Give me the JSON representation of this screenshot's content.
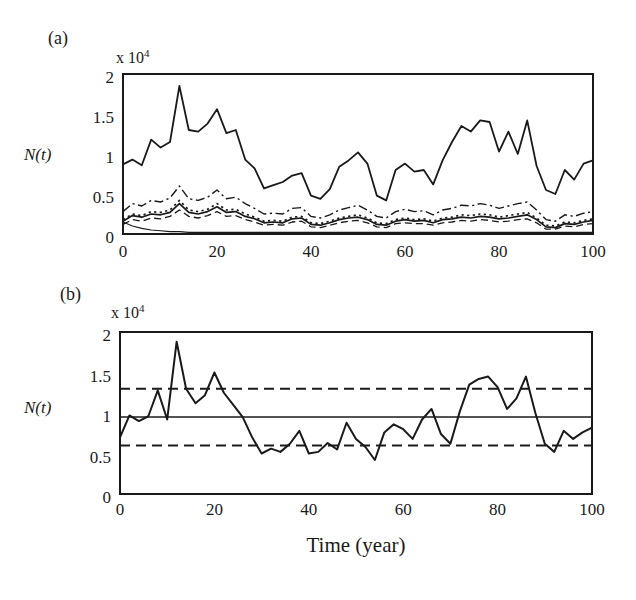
{
  "figure": {
    "xlabel": "Time (year)",
    "colors": {
      "background": "#ffffff",
      "ink": "#1a1a1a"
    }
  },
  "chart_data": [
    {
      "id": "panel-a",
      "type": "line",
      "panel_label": "(a)",
      "scale_label": {
        "base": "x 10",
        "exp": "4"
      },
      "ylabel": "N(t)",
      "xlim": [
        0,
        100
      ],
      "ylim": [
        0,
        2
      ],
      "grid": false,
      "legend": false,
      "x_ticks": [
        {
          "label": "0",
          "value": 0
        },
        {
          "label": "20",
          "value": 20
        },
        {
          "label": "40",
          "value": 40
        },
        {
          "label": "60",
          "value": 60
        },
        {
          "label": "80",
          "value": 80
        },
        {
          "label": "100",
          "value": 100
        }
      ],
      "y_ticks": [
        {
          "label": "2",
          "value": 2
        },
        {
          "label": "1.5",
          "value": 1.5
        },
        {
          "label": "1",
          "value": 1
        },
        {
          "label": "0.5",
          "value": 0.5
        },
        {
          "label": "0",
          "value": 0
        }
      ],
      "x": [
        0,
        2,
        4,
        6,
        8,
        10,
        12,
        14,
        16,
        18,
        20,
        22,
        24,
        26,
        28,
        30,
        32,
        34,
        36,
        38,
        40,
        42,
        44,
        46,
        48,
        50,
        52,
        54,
        56,
        58,
        60,
        62,
        64,
        66,
        68,
        70,
        72,
        74,
        76,
        78,
        80,
        82,
        84,
        86,
        88,
        90,
        92,
        94,
        96,
        98,
        100
      ],
      "series": [
        {
          "name": "total-population-solid",
          "style": "solid",
          "width": 1.8,
          "values": [
            0.87,
            0.93,
            0.86,
            1.18,
            1.08,
            1.15,
            1.85,
            1.3,
            1.28,
            1.38,
            1.56,
            1.26,
            1.3,
            0.93,
            0.82,
            0.57,
            0.61,
            0.65,
            0.73,
            0.76,
            0.48,
            0.44,
            0.56,
            0.84,
            0.92,
            1.02,
            0.88,
            0.48,
            0.42,
            0.8,
            0.88,
            0.78,
            0.8,
            0.62,
            0.92,
            1.15,
            1.35,
            1.28,
            1.42,
            1.4,
            1.03,
            1.28,
            1.0,
            1.42,
            0.85,
            0.55,
            0.5,
            0.8,
            0.68,
            0.88,
            0.92
          ]
        },
        {
          "name": "subpopulation-dash-dot",
          "style": "dashdot",
          "width": 1.4,
          "values": [
            0.28,
            0.38,
            0.35,
            0.42,
            0.4,
            0.45,
            0.6,
            0.44,
            0.42,
            0.46,
            0.55,
            0.44,
            0.46,
            0.38,
            0.32,
            0.25,
            0.26,
            0.25,
            0.32,
            0.33,
            0.22,
            0.2,
            0.24,
            0.3,
            0.33,
            0.36,
            0.3,
            0.22,
            0.2,
            0.28,
            0.31,
            0.28,
            0.29,
            0.24,
            0.3,
            0.32,
            0.36,
            0.35,
            0.38,
            0.36,
            0.32,
            0.35,
            0.38,
            0.4,
            0.3,
            0.18,
            0.16,
            0.24,
            0.22,
            0.26,
            0.28
          ]
        },
        {
          "name": "subpopulation-dotted",
          "style": "dotted",
          "width": 1.7,
          "values": [
            0.18,
            0.25,
            0.23,
            0.28,
            0.27,
            0.3,
            0.42,
            0.3,
            0.28,
            0.31,
            0.38,
            0.3,
            0.31,
            0.25,
            0.21,
            0.16,
            0.17,
            0.16,
            0.21,
            0.22,
            0.14,
            0.13,
            0.16,
            0.2,
            0.22,
            0.24,
            0.2,
            0.14,
            0.13,
            0.18,
            0.2,
            0.18,
            0.19,
            0.16,
            0.2,
            0.21,
            0.24,
            0.23,
            0.25,
            0.24,
            0.21,
            0.23,
            0.25,
            0.27,
            0.2,
            0.11,
            0.1,
            0.15,
            0.14,
            0.17,
            0.19
          ]
        },
        {
          "name": "subpopulation-solid",
          "style": "solid",
          "width": 1.7,
          "values": [
            0.16,
            0.23,
            0.21,
            0.25,
            0.24,
            0.27,
            0.38,
            0.27,
            0.25,
            0.28,
            0.34,
            0.27,
            0.28,
            0.22,
            0.19,
            0.14,
            0.15,
            0.14,
            0.19,
            0.2,
            0.12,
            0.11,
            0.14,
            0.18,
            0.2,
            0.21,
            0.18,
            0.12,
            0.11,
            0.16,
            0.18,
            0.16,
            0.17,
            0.14,
            0.18,
            0.19,
            0.21,
            0.2,
            0.22,
            0.21,
            0.19,
            0.2,
            0.22,
            0.24,
            0.18,
            0.09,
            0.08,
            0.13,
            0.12,
            0.15,
            0.17
          ]
        },
        {
          "name": "subpopulation-dashed",
          "style": "dashed",
          "width": 1.3,
          "values": [
            0.12,
            0.18,
            0.16,
            0.2,
            0.19,
            0.22,
            0.3,
            0.22,
            0.2,
            0.23,
            0.28,
            0.22,
            0.23,
            0.18,
            0.15,
            0.11,
            0.12,
            0.11,
            0.15,
            0.16,
            0.09,
            0.08,
            0.11,
            0.14,
            0.16,
            0.17,
            0.14,
            0.09,
            0.08,
            0.13,
            0.14,
            0.13,
            0.13,
            0.11,
            0.14,
            0.15,
            0.17,
            0.16,
            0.18,
            0.17,
            0.15,
            0.16,
            0.18,
            0.19,
            0.14,
            0.06,
            0.06,
            0.1,
            0.09,
            0.12,
            0.13
          ]
        },
        {
          "name": "declining-population-thin",
          "style": "solid",
          "width": 1.1,
          "values": [
            0.15,
            0.1,
            0.07,
            0.05,
            0.04,
            0.03,
            0.03,
            0.02,
            0.02,
            0.02,
            0.02,
            0.02,
            0.02,
            0.02,
            0.02,
            0.02,
            0.02,
            0.02,
            0.02,
            0.02,
            0.02,
            0.02,
            0.02,
            0.02,
            0.02,
            0.02,
            0.02,
            0.02,
            0.02,
            0.02,
            0.02,
            0.02,
            0.02,
            0.02,
            0.02,
            0.02,
            0.02,
            0.02,
            0.02,
            0.02,
            0.02,
            0.02,
            0.02,
            0.02,
            0.02,
            0.02,
            0.02,
            0.02,
            0.02,
            0.02,
            0.02
          ]
        }
      ]
    },
    {
      "id": "panel-b",
      "type": "line",
      "panel_label": "(b)",
      "scale_label": {
        "base": "x 10",
        "exp": "4"
      },
      "ylabel": "N(t)",
      "xlim": [
        0,
        100
      ],
      "ylim": [
        0,
        2
      ],
      "grid": false,
      "legend": false,
      "x_ticks": [
        {
          "label": "0",
          "value": 0
        },
        {
          "label": "20",
          "value": 20
        },
        {
          "label": "40",
          "value": 40
        },
        {
          "label": "60",
          "value": 60
        },
        {
          "label": "80",
          "value": 80
        },
        {
          "label": "100",
          "value": 100
        }
      ],
      "y_ticks": [
        {
          "label": "2",
          "value": 2
        },
        {
          "label": "1.5",
          "value": 1.5
        },
        {
          "label": "1",
          "value": 1
        },
        {
          "label": "0.5",
          "value": 0.5
        },
        {
          "label": "0",
          "value": 0
        }
      ],
      "x": [
        0,
        2,
        4,
        6,
        8,
        10,
        12,
        14,
        16,
        18,
        20,
        22,
        24,
        26,
        28,
        30,
        32,
        34,
        36,
        38,
        40,
        42,
        44,
        46,
        48,
        50,
        52,
        54,
        56,
        58,
        60,
        62,
        64,
        66,
        68,
        70,
        72,
        74,
        76,
        78,
        80,
        82,
        84,
        86,
        88,
        90,
        92,
        94,
        96,
        98,
        100
      ],
      "series": [
        {
          "name": "population-solid",
          "style": "solid",
          "width": 2,
          "values": [
            0.7,
            0.97,
            0.9,
            0.96,
            1.28,
            0.92,
            1.88,
            1.3,
            1.12,
            1.22,
            1.5,
            1.25,
            1.1,
            0.95,
            0.7,
            0.5,
            0.56,
            0.52,
            0.62,
            0.78,
            0.5,
            0.52,
            0.63,
            0.55,
            0.88,
            0.68,
            0.58,
            0.42,
            0.76,
            0.86,
            0.8,
            0.68,
            0.92,
            1.05,
            0.74,
            0.62,
            1.02,
            1.35,
            1.42,
            1.45,
            1.32,
            1.05,
            1.18,
            1.45,
            1.0,
            0.62,
            0.52,
            0.78,
            0.68,
            0.76,
            0.82
          ]
        }
      ],
      "reference_lines": [
        {
          "name": "upper-bound-dashed",
          "value": 1.3,
          "style": "long-dashed",
          "width": 2
        },
        {
          "name": "mean-solid",
          "value": 0.95,
          "style": "solid",
          "width": 1.5
        },
        {
          "name": "lower-bound-dashed",
          "value": 0.6,
          "style": "long-dashed",
          "width": 2
        }
      ]
    }
  ]
}
